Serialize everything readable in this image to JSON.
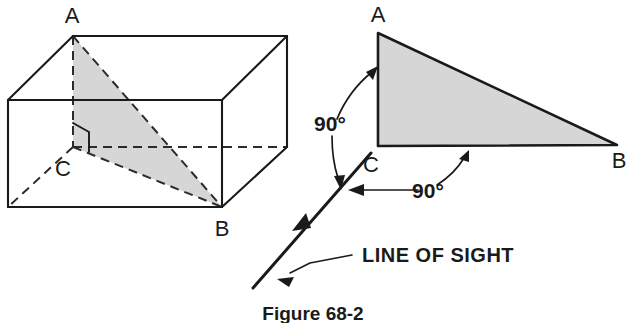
{
  "figure": {
    "caption": "Figure 68-2",
    "left_view": {
      "name": "pictorial-box-view",
      "vertex_labels": [
        "A",
        "C",
        "B"
      ],
      "labels": {
        "a": "A",
        "b": "B",
        "c": "C"
      },
      "right_angle_marker_at": "C"
    },
    "right_view": {
      "name": "true-shape-triangle-view",
      "labels": {
        "a": "A",
        "b": "B",
        "c": "C"
      },
      "angle_callouts": [
        {
          "id": "angle-at-a-edge",
          "value": "90°"
        },
        {
          "id": "angle-at-c-base",
          "value": "90°"
        }
      ],
      "line_of_sight_label": "LINE OF SIGHT"
    },
    "colors": {
      "shading": "#d6d6d6",
      "ink": "#1a1a1a",
      "background": "#ffffff"
    }
  }
}
